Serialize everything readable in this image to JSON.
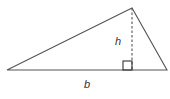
{
  "diagram": {
    "type": "triangle-area",
    "labels": {
      "height": "h",
      "base": "b"
    },
    "colors": {
      "stroke": "#555555",
      "text": "#333333",
      "background": "#ffffff"
    }
  }
}
